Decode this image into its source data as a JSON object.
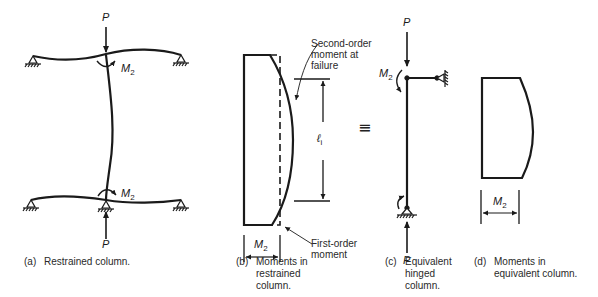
{
  "figure": {
    "panels": [
      {
        "id": "a",
        "caption_tag": "(a)",
        "caption": "Restrained column.",
        "labels": {
          "load_top": "P",
          "load_bottom": "P",
          "moment_top": "M",
          "moment_top_sub": "2",
          "moment_bottom": "M",
          "moment_bottom_sub": "2"
        }
      },
      {
        "id": "b",
        "caption_tag": "(b)",
        "caption_lines": [
          "Moments in",
          "restrained",
          "column."
        ],
        "labels": {
          "second_order": [
            "Second-order",
            "moment at",
            "failure"
          ],
          "first_order": [
            "First-order",
            "moment"
          ],
          "length": "ℓ",
          "length_sub": "i",
          "width": "M",
          "width_sub": "2"
        }
      },
      {
        "id": "c",
        "caption_tag": "(c)",
        "caption_lines": [
          "Equivalent",
          "hinged",
          "column."
        ],
        "labels": {
          "load_top": "P",
          "load_bottom": "P",
          "moment": "M",
          "moment_sub": "2"
        }
      },
      {
        "id": "d",
        "caption_tag": "(d)",
        "caption_lines": [
          "Moments in",
          "equivalent column."
        ],
        "labels": {
          "width": "M",
          "width_sub": "2"
        }
      }
    ],
    "equivalence_symbol": "≡",
    "colors": {
      "ink": "#1a1a1a",
      "background": "#ffffff"
    }
  }
}
